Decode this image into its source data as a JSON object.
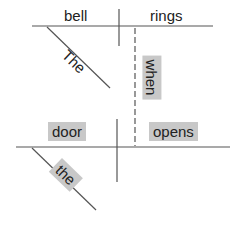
{
  "diagram": {
    "type": "sentence-diagram",
    "main_clause": {
      "subject": "bell",
      "verb": "rings",
      "modifiers": [
        {
          "word": "The",
          "modifies": "bell",
          "highlighted": false
        }
      ]
    },
    "subordinate_clause": {
      "conjunction": "when",
      "subject": "door",
      "verb": "opens",
      "modifiers": [
        {
          "word": "the",
          "modifies": "door",
          "highlighted": true
        }
      ]
    },
    "highlight_color": "#c8c8c8",
    "line_color": "#555555"
  }
}
